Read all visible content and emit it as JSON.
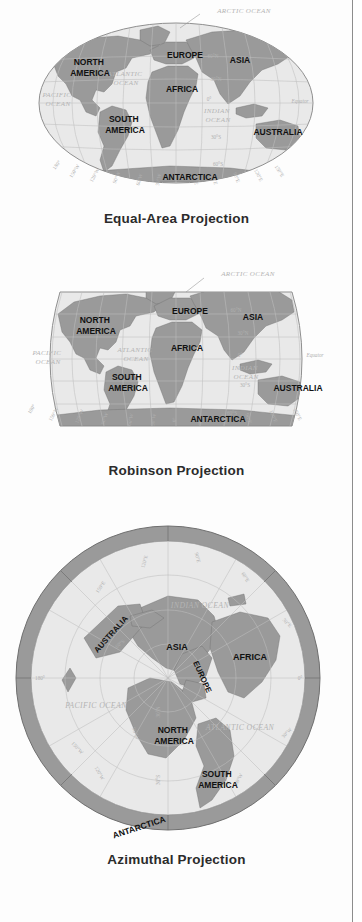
{
  "figure": {
    "kind": "map-projection-comparison",
    "colors": {
      "land": "#9a9a9a",
      "land_dark": "#8a8a8a",
      "ocean": "#e9e9e9",
      "ocean_light": "#efefef",
      "graticule": "#bfbfbf",
      "outline": "#6f6f6f",
      "label_dark": "#111111",
      "label_ocean": "#b4b4b4",
      "caption": "#2b2b2b",
      "page_rule": "#8d8d8d",
      "ring": "#8f8f8f"
    },
    "maps": [
      {
        "id": "equal-area",
        "caption": "Equal-Area Projection",
        "projection_shape": "ellipse",
        "continents": [
          {
            "name": "NORTH\nAMERICA",
            "line1": "NORTH",
            "line2": "AMERICA"
          },
          {
            "name": "SOUTH\nAMERICA",
            "line1": "SOUTH",
            "line2": "AMERICA"
          },
          {
            "name": "EUROPE",
            "line1": "EUROPE",
            "line2": ""
          },
          {
            "name": "AFRICA",
            "line1": "AFRICA",
            "line2": ""
          },
          {
            "name": "ASIA",
            "line1": "ASIA",
            "line2": ""
          },
          {
            "name": "AUSTRALIA",
            "line1": "AUSTRALIA",
            "line2": ""
          },
          {
            "name": "ANTARCTICA",
            "line1": "ANTARCTICA",
            "line2": ""
          }
        ],
        "oceans": [
          {
            "name": "ARCTIC OCEAN",
            "line1": "ARCTIC OCEAN",
            "line2": ""
          },
          {
            "name": "PACIFIC OCEAN",
            "line1": "PACIFIC",
            "line2": "OCEAN"
          },
          {
            "name": "ATLANTIC OCEAN",
            "line1": "ATLANTIC",
            "line2": "OCEAN"
          },
          {
            "name": "INDIAN OCEAN",
            "line1": "INDIAN",
            "line2": "OCEAN"
          }
        ],
        "latitudes": [
          "60°N",
          "30°N",
          "0°",
          "30°S",
          "60°S"
        ],
        "longitudes": [
          "180°",
          "150°W",
          "120°W",
          "90°W",
          "60°W",
          "30°W",
          "0°",
          "30°E",
          "60°E",
          "90°E",
          "120°E",
          "150°E"
        ],
        "equator_label": "Equator"
      },
      {
        "id": "robinson",
        "caption": "Robinson Projection",
        "projection_shape": "rounded-rectangle",
        "continents": [
          {
            "name": "NORTH\nAMERICA",
            "line1": "NORTH",
            "line2": "AMERICA"
          },
          {
            "name": "SOUTH\nAMERICA",
            "line1": "SOUTH",
            "line2": "AMERICA"
          },
          {
            "name": "EUROPE",
            "line1": "EUROPE",
            "line2": ""
          },
          {
            "name": "AFRICA",
            "line1": "AFRICA",
            "line2": ""
          },
          {
            "name": "ASIA",
            "line1": "ASIA",
            "line2": ""
          },
          {
            "name": "AUSTRALIA",
            "line1": "AUSTRALIA",
            "line2": ""
          },
          {
            "name": "ANTARCTICA",
            "line1": "ANTARCTICA",
            "line2": ""
          }
        ],
        "oceans": [
          {
            "name": "ARCTIC OCEAN",
            "line1": "ARCTIC OCEAN",
            "line2": ""
          },
          {
            "name": "PACIFIC OCEAN",
            "line1": "PACIFIC",
            "line2": "OCEAN"
          },
          {
            "name": "ATLANTIC OCEAN",
            "line1": "ATLANTIC",
            "line2": "OCEAN"
          },
          {
            "name": "INDIAN OCEAN",
            "line1": "INDIAN",
            "line2": "OCEAN"
          }
        ],
        "latitudes": [
          "60°N",
          "30°N",
          "0°",
          "30°S",
          "60°S"
        ],
        "longitudes": [
          "180°",
          "150°W",
          "120°W",
          "90°W",
          "60°W",
          "30°W",
          "0°",
          "30°E",
          "60°E",
          "90°E",
          "120°E",
          "150°E"
        ],
        "equator_label": "Equator"
      },
      {
        "id": "azimuthal",
        "caption": "Azimuthal Projection",
        "projection_shape": "circle",
        "continents": [
          {
            "name": "AUSTRALIA",
            "line1": "AUSTRALIA",
            "line2": ""
          },
          {
            "name": "ASIA",
            "line1": "ASIA",
            "line2": ""
          },
          {
            "name": "AFRICA",
            "line1": "AFRICA",
            "line2": ""
          },
          {
            "name": "EUROPE",
            "line1": "EUROPE",
            "line2": ""
          },
          {
            "name": "NORTH\nAMERICA",
            "line1": "NORTH",
            "line2": "AMERICA"
          },
          {
            "name": "SOUTH\nAMERICA",
            "line1": "SOUTH",
            "line2": "AMERICA"
          },
          {
            "name": "ANTARCTICA",
            "line1": "ANTARCTICA",
            "line2": ""
          }
        ],
        "oceans": [
          {
            "name": "INDIAN OCEAN",
            "line1": "INDIAN OCEAN",
            "line2": ""
          },
          {
            "name": "PACIFIC OCEAN",
            "line1": "PACIFIC OCEAN",
            "line2": ""
          },
          {
            "name": "ATLANTIC OCEAN",
            "line1": "ATLANTIC OCEAN",
            "line2": ""
          }
        ],
        "latitudes": [
          "30°N",
          "0°",
          "30°S",
          "60°S"
        ],
        "longitudes": [
          "180°",
          "150°W",
          "120°W",
          "90°W",
          "60°W",
          "30°W",
          "0°",
          "30°E",
          "60°E",
          "90°E",
          "120°E",
          "150°E"
        ],
        "equator_label": ""
      }
    ]
  }
}
